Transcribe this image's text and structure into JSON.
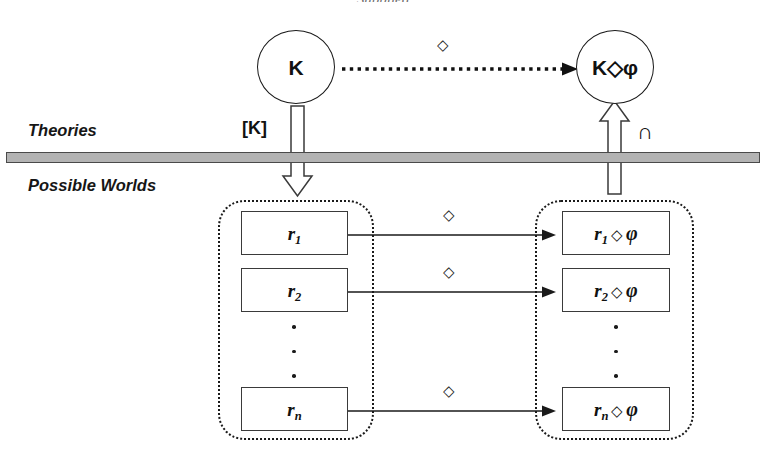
{
  "figure": {
    "top_caption": "Supplied",
    "region_labels": {
      "upper": "Theories",
      "lower": "Possible Worlds"
    }
  },
  "theory_nodes": {
    "source": {
      "label": "K"
    },
    "target": {
      "label": "K◇φ"
    }
  },
  "top_arrow": {
    "operator_label": "◇",
    "style": "dotted"
  },
  "down_arrow": {
    "label": "[K]",
    "style": "hollow-block"
  },
  "up_arrow": {
    "label": "∩",
    "style": "hollow-block"
  },
  "left_container": {
    "name": "possible-worlds-source-set",
    "boxes": [
      {
        "base": "r",
        "sub": "1"
      },
      {
        "base": "r",
        "sub": "2"
      },
      {
        "base": "r",
        "sub": "n"
      }
    ],
    "ellipsis_dots": 3
  },
  "right_container": {
    "name": "possible-worlds-result-set",
    "boxes": [
      {
        "base": "r",
        "sub": "1",
        "op": "◇",
        "arg": "φ"
      },
      {
        "base": "r",
        "sub": "2",
        "op": "◇",
        "arg": "φ"
      },
      {
        "base": "r",
        "sub": "n",
        "op": "◇",
        "arg": "φ"
      }
    ],
    "ellipsis_dots": 3
  },
  "world_arrows": [
    {
      "operator_label": "◇"
    },
    {
      "operator_label": "◇"
    },
    {
      "operator_label": "◇"
    }
  ],
  "colors": {
    "stroke": "#1a1a1a",
    "bar_fill": "#b3b3b3",
    "bar_border": "#4a4a4a",
    "background": "#ffffff"
  }
}
